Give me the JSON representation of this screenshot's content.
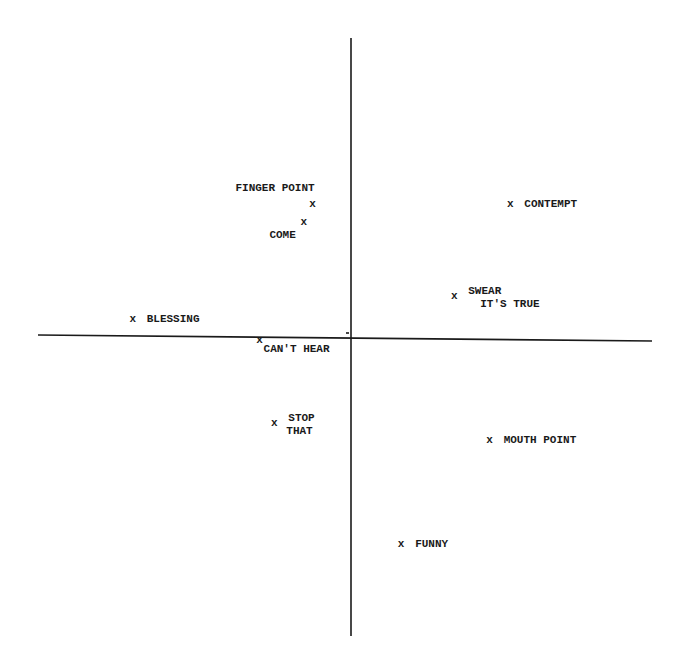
{
  "chart_data": {
    "type": "scatter",
    "title": "",
    "xlabel": "",
    "ylabel": "",
    "grid": false,
    "legend": null,
    "axes": {
      "x_range": [
        -1,
        1
      ],
      "y_range": [
        -1,
        1
      ],
      "origin_centered": true,
      "ticks": false
    },
    "marker": "x",
    "points": [
      {
        "label": "FINGER POINT",
        "lines": [
          "FINGER POINT"
        ],
        "x": -0.13,
        "y": 0.45,
        "label_pos": "above-left"
      },
      {
        "label": "COME",
        "lines": [
          "COME"
        ],
        "x": -0.16,
        "y": 0.39,
        "label_pos": "below-left"
      },
      {
        "label": "CONTEMPT",
        "lines": [
          "CONTEMPT"
        ],
        "x": 0.54,
        "y": 0.45,
        "label_pos": "right"
      },
      {
        "label": "SWEAR IT'S TRUE",
        "lines": [
          "SWEAR",
          "IT'S TRUE"
        ],
        "x": 0.35,
        "y": 0.14,
        "label_pos": "right"
      },
      {
        "label": "BLESSING",
        "lines": [
          "BLESSING"
        ],
        "x": -0.74,
        "y": 0.06,
        "label_pos": "right"
      },
      {
        "label": "CAN'T HEAR",
        "lines": [
          "CAN'T HEAR"
        ],
        "x": -0.31,
        "y": -0.01,
        "label_pos": "below-right"
      },
      {
        "label": "STOP THAT",
        "lines": [
          "STOP",
          "THAT"
        ],
        "x": -0.26,
        "y": -0.29,
        "label_pos": "right"
      },
      {
        "label": "MOUTH POINT",
        "lines": [
          "MOUTH POINT"
        ],
        "x": 0.47,
        "y": -0.35,
        "label_pos": "right"
      },
      {
        "label": "FUNNY",
        "lines": [
          "FUNNY"
        ],
        "x": 0.17,
        "y": -0.7,
        "label_pos": "right"
      }
    ]
  },
  "render": {
    "origin_px": [
      351,
      336
    ],
    "x_axis_px": [
      38,
      652
    ],
    "y_axis_px": [
      38,
      636
    ],
    "scale_px": 295
  }
}
